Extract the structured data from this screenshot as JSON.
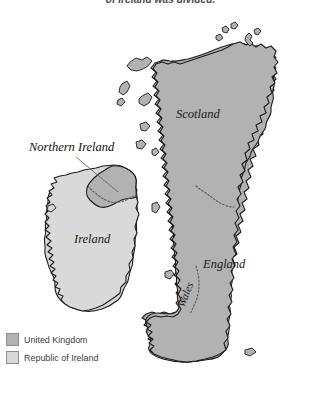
{
  "caption": {
    "text": "of Ireland was divided."
  },
  "map": {
    "labels": [
      {
        "id": "scotland",
        "text": "Scotland"
      },
      {
        "id": "england",
        "text": "England"
      },
      {
        "id": "wales",
        "text": "Wales"
      },
      {
        "id": "ireland",
        "text": "Ireland"
      },
      {
        "id": "northern-ireland",
        "text": "Northern Ireland"
      }
    ]
  },
  "legend": {
    "items": [
      {
        "id": "united-kingdom",
        "label": "United Kingdom",
        "color": "#b2b2b2"
      },
      {
        "id": "republic-of-ireland",
        "label": "Republic of Ireland",
        "color": "#d9d9d9"
      }
    ]
  },
  "colors": {
    "uk_fill": "#b2b2b2",
    "roi_fill": "#d9d9d9",
    "coastline": "#1c1c1c",
    "internal_border": "#5a5a5a",
    "background": "#ffffff"
  }
}
